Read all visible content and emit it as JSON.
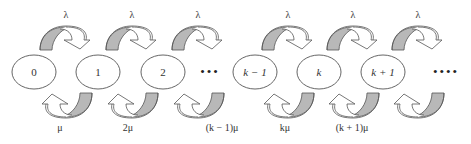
{
  "diagram": {
    "type": "birth-death-state-transition",
    "nodes": [
      {
        "id": "s0",
        "label": "0",
        "cx": 34
      },
      {
        "id": "s1",
        "label": "1",
        "cx": 98
      },
      {
        "id": "s2",
        "label": "2",
        "cx": 163
      },
      {
        "id": "dots1",
        "label": "•••",
        "cx": 210,
        "ellipsis": true
      },
      {
        "id": "skm1",
        "label": "k − 1",
        "cx": 255
      },
      {
        "id": "sk",
        "label": "k",
        "cx": 319
      },
      {
        "id": "skp1",
        "label": "k + 1",
        "cx": 383
      },
      {
        "id": "dots2",
        "label": "••••",
        "cx": 446,
        "ellipsis": true
      }
    ],
    "forward_rates": [
      {
        "label": "λ",
        "x": 66
      },
      {
        "label": "λ",
        "x": 132
      },
      {
        "label": "λ",
        "x": 198
      },
      {
        "label": "λ",
        "x": 288
      },
      {
        "label": "λ",
        "x": 353
      },
      {
        "label": "λ",
        "x": 418
      }
    ],
    "backward_rates": [
      {
        "label": "μ",
        "x": 60
      },
      {
        "label": "2μ",
        "x": 128
      },
      {
        "label": "(k − 1)μ",
        "x": 222
      },
      {
        "label": "kμ",
        "x": 285
      },
      {
        "label": "(k + 1)μ",
        "x": 352
      }
    ],
    "colors": {
      "stroke": "#555555",
      "band_fill": "#b8b8b8",
      "arrow_fill": "#ffffff",
      "text": "#333333"
    }
  }
}
